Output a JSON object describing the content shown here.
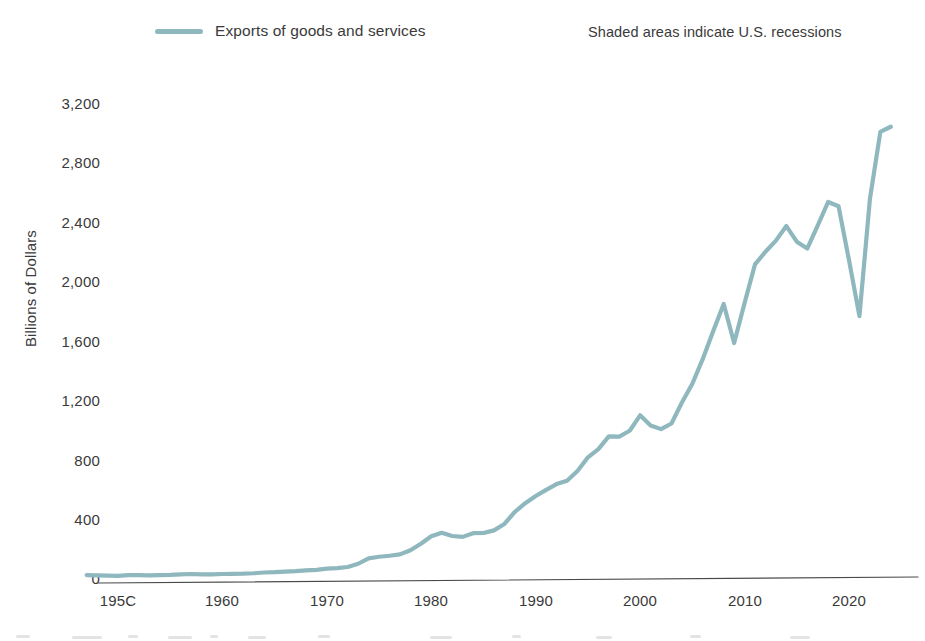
{
  "legend": {
    "series_label": "Exports of goods and services",
    "swatch_color": "#8fb8be",
    "recession_note": "Shaded areas indicate U.S. recessions"
  },
  "axes": {
    "ylabel": "Billions of Dollars",
    "yticks": [
      "0",
      "400",
      "800",
      "1,200",
      "1,600",
      "2,000",
      "2,400",
      "2,800",
      "3,200"
    ],
    "xticks": [
      "195C",
      "1960",
      "1970",
      "1980",
      "1990",
      "2000",
      "2010",
      "2020"
    ]
  },
  "chart_data": {
    "type": "line",
    "title": "",
    "subtitle": "",
    "xlabel": "",
    "ylabel": "Billions of Dollars",
    "xlim": [
      1947,
      2024
    ],
    "ylim": [
      0,
      3200
    ],
    "grid": false,
    "legend_position": "top-left",
    "annotations": [
      "Shaded areas indicate U.S. recessions"
    ],
    "ytick_values": [
      0,
      400,
      800,
      1200,
      1600,
      2000,
      2400,
      2800,
      3200
    ],
    "xtick_values": [
      1950,
      1960,
      1970,
      1980,
      1990,
      2000,
      2010,
      2020
    ],
    "xtick_labels": [
      "195C",
      "1960",
      "1970",
      "1980",
      "1990",
      "2000",
      "2010",
      "2020"
    ],
    "series": [
      {
        "name": "Exports of goods and services",
        "color": "#8fb8be",
        "x": [
          1947,
          1948,
          1949,
          1950,
          1951,
          1952,
          1953,
          1954,
          1955,
          1956,
          1957,
          1958,
          1959,
          1960,
          1961,
          1962,
          1963,
          1964,
          1965,
          1966,
          1967,
          1968,
          1969,
          1970,
          1971,
          1972,
          1973,
          1974,
          1975,
          1976,
          1977,
          1978,
          1979,
          1980,
          1981,
          1982,
          1983,
          1984,
          1985,
          1986,
          1987,
          1988,
          1989,
          1990,
          1991,
          1992,
          1993,
          1994,
          1995,
          1996,
          1997,
          1998,
          1999,
          2000,
          2001,
          2002,
          2003,
          2004,
          2005,
          2006,
          2007,
          2008,
          2009,
          2010,
          2011,
          2012,
          2013,
          2014,
          2015,
          2016,
          2017,
          2018,
          2019,
          2020,
          2021,
          2022,
          2023,
          2024
        ],
        "y": [
          20,
          18,
          16,
          14,
          19,
          19,
          18,
          19,
          21,
          25,
          27,
          24,
          24,
          27,
          28,
          29,
          32,
          37,
          39,
          43,
          46,
          51,
          55,
          63,
          67,
          74,
          96,
          132,
          143,
          150,
          159,
          187,
          231,
          281,
          305,
          283,
          277,
          302,
          303,
          321,
          364,
          445,
          504,
          552,
          594,
          633,
          655,
          721,
          813,
          868,
          954,
          953,
          992,
          1096,
          1027,
          1003,
          1041,
          1182,
          1309,
          1476,
          1664,
          1846,
          1583,
          1853,
          2113,
          2198,
          2273,
          2371,
          2266,
          2219,
          2374,
          2533,
          2504,
          2141,
          1764,
          2552,
          3005,
          3040
        ]
      }
    ]
  }
}
